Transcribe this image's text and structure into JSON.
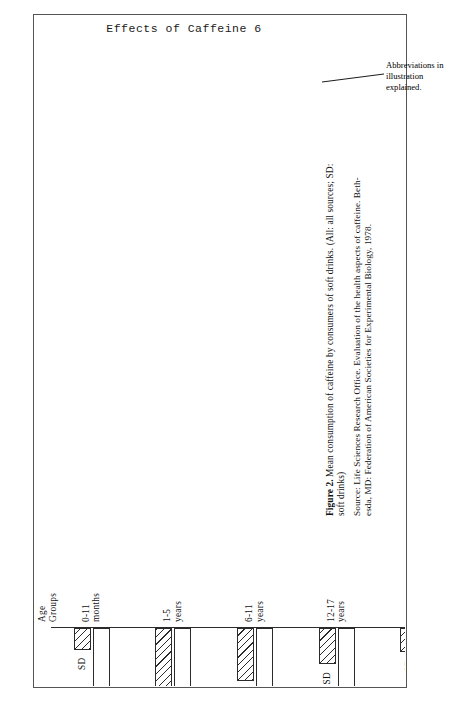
{
  "page": {
    "running_header": "Effects of Caffeine 6"
  },
  "annotation": {
    "line1": "Abbreviations in",
    "line2": "illustration",
    "line3": "explained."
  },
  "caption": {
    "label": "Figure 2.",
    "text_line1": "Mean consumption of caffeine by consumers of soft drinks. (All: all sources; SD:",
    "text_line2": "soft drinks)"
  },
  "source": {
    "line1": "Source: Life Sciences Research Office. Evaluation of the health aspects of caffeine. Beth-",
    "line2": "esda, MD: Federation of American Societies for Experimental Biology, 1978."
  },
  "chart_data": {
    "type": "bar",
    "orientation": "horizontal",
    "title": "Mean consumption of caffeine by consumers of soft drinks",
    "xlabel": "Age Groups",
    "ylabel": "Milligrams/kilogram of body weight per day",
    "categories": [
      "0-11 months",
      "1-5 years",
      "6-11 years",
      "12-17 years",
      "18+ years"
    ],
    "category_lines": [
      [
        "0-11",
        "months"
      ],
      [
        "1-5",
        "years"
      ],
      [
        "6-11",
        "years"
      ],
      [
        "12-17",
        "years"
      ],
      [
        "18+",
        "years"
      ]
    ],
    "series": [
      {
        "name": "All",
        "label": "All",
        "fill": "solid-white",
        "values": [
          0.73,
          1.55,
          1.35,
          1.15,
          2.4
        ]
      },
      {
        "name": "SD",
        "label": "SD",
        "fill": "hatched",
        "values": [
          0.23,
          0.65,
          0.55,
          0.38,
          0.25
        ]
      }
    ],
    "legend_in_bar_labels": true,
    "ylim": [
      0.0,
      2.5
    ],
    "tick_values": [
      0.0,
      0.5,
      1.0,
      1.5,
      2.0,
      2.5
    ],
    "tick_labels": [
      "0.00",
      "0.50",
      "1.00",
      "1.50",
      "2.00",
      "2.50"
    ],
    "grid": false,
    "axis_title_category": "Age Groups",
    "axis_title_category_lines": [
      "Age",
      "Groups"
    ],
    "colors": {
      "ink": "#2b2b2b",
      "bar_all_fill": "#ffffff",
      "bar_sd_fill": "#ffffff",
      "hatch": "#2b2b2b"
    }
  }
}
